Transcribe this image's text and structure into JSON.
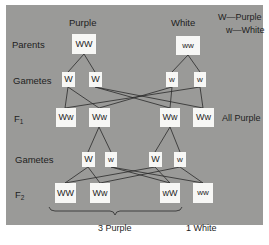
{
  "headers": {
    "left": "Purple",
    "right": "White"
  },
  "legend": {
    "line1": "W—Purple",
    "line2": "w—White"
  },
  "row_labels": {
    "parents": "Parents",
    "gametes1": "Gametes",
    "f1_main": "F",
    "f1_sub": "1",
    "gametes2": "Gametes",
    "f2_main": "F",
    "f2_sub": "2"
  },
  "parents": [
    "WW",
    "ww"
  ],
  "gametes1": [
    "W",
    "W",
    "w",
    "w"
  ],
  "f1": [
    "Ww",
    "Ww",
    "Ww",
    "Ww"
  ],
  "f1_note": "All Purple",
  "gametes2": [
    "W",
    "w",
    "W",
    "w"
  ],
  "f2": [
    "WW",
    "Ww",
    "wW",
    "ww"
  ],
  "results": {
    "purple": "3 Purple",
    "white": "1 White"
  },
  "colors": {
    "panel": "#9a9a98",
    "box": "#f7f7f5",
    "line": "#2a2a2a",
    "text": "#1e1e1e"
  }
}
